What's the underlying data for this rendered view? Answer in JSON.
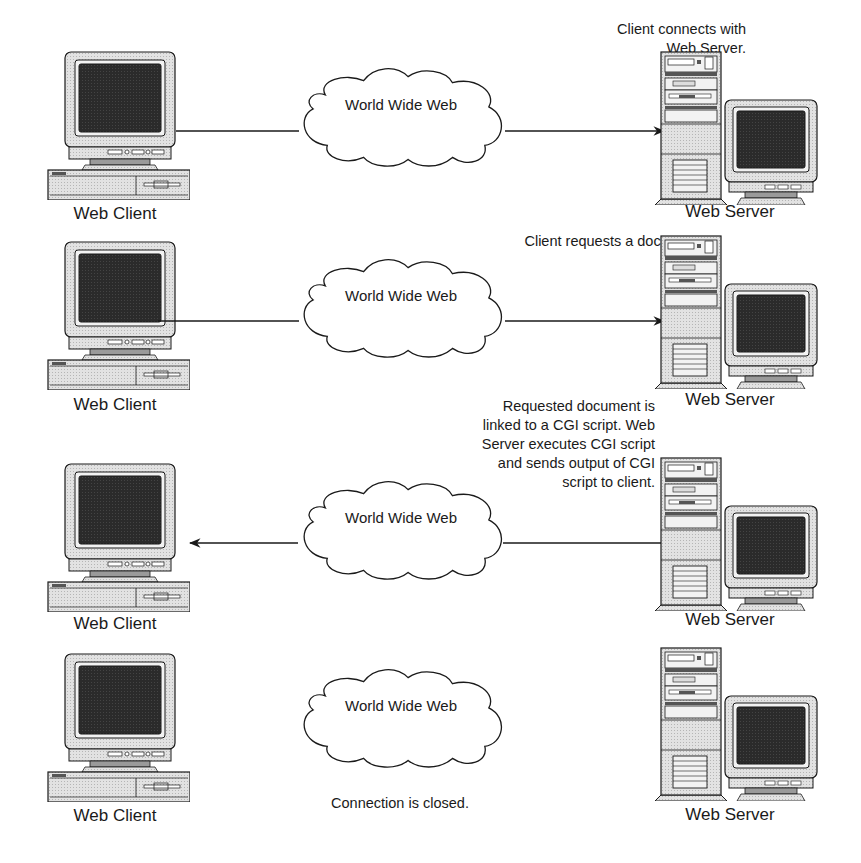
{
  "diagram": {
    "colors": {
      "line": "#1a1a1a",
      "screen": "#2b2b2b",
      "case": "#d9d9d9",
      "case_light": "#e8e8e8",
      "background": "#ffffff"
    },
    "steps": [
      {
        "client_label": "Web Client",
        "server_label": "Web Server",
        "cloud_label": "World Wide Web",
        "caption": [
          "Client connects with",
          "Web Server."
        ],
        "arrow_direction": "client-to-server"
      },
      {
        "client_label": "Web Client",
        "server_label": "Web Server",
        "cloud_label": "World Wide Web",
        "caption": [
          "Client requests a document."
        ],
        "arrow_direction": "client-to-server"
      },
      {
        "client_label": "Web Client",
        "server_label": "Web Server",
        "cloud_label": "World Wide Web",
        "caption": [
          "Requested document is",
          "linked to a CGI script. Web",
          "Server executes CGI script",
          "and sends output of CGI",
          "script to client."
        ],
        "arrow_direction": "server-to-client"
      },
      {
        "client_label": "Web Client",
        "server_label": "Web Server",
        "cloud_label": "World Wide Web",
        "caption": [
          "Connection is closed."
        ],
        "arrow_direction": "none"
      }
    ]
  }
}
